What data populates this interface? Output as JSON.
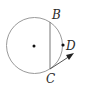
{
  "diagram": {
    "type": "circle-geometry",
    "circle": {
      "cx": 34.5,
      "cy": 45.5,
      "r": 28,
      "stroke": "#9a9a9a"
    },
    "center_point": {
      "x": 34,
      "y": 46
    },
    "chord": {
      "from": "B",
      "to": "C",
      "x1": 50,
      "y1": 22,
      "x2": 50,
      "y2": 69
    },
    "points": [
      {
        "label": "B",
        "x": 50,
        "y": 22
      },
      {
        "label": "C",
        "x": 50,
        "y": 69
      },
      {
        "label": "D",
        "x": 63,
        "y": 45
      }
    ],
    "ray": {
      "from": "C",
      "x1": 50,
      "y1": 69,
      "x2": 73,
      "y2": 54,
      "arrow": true
    },
    "labels": {
      "b": "B",
      "c": "C",
      "d": "D"
    }
  }
}
